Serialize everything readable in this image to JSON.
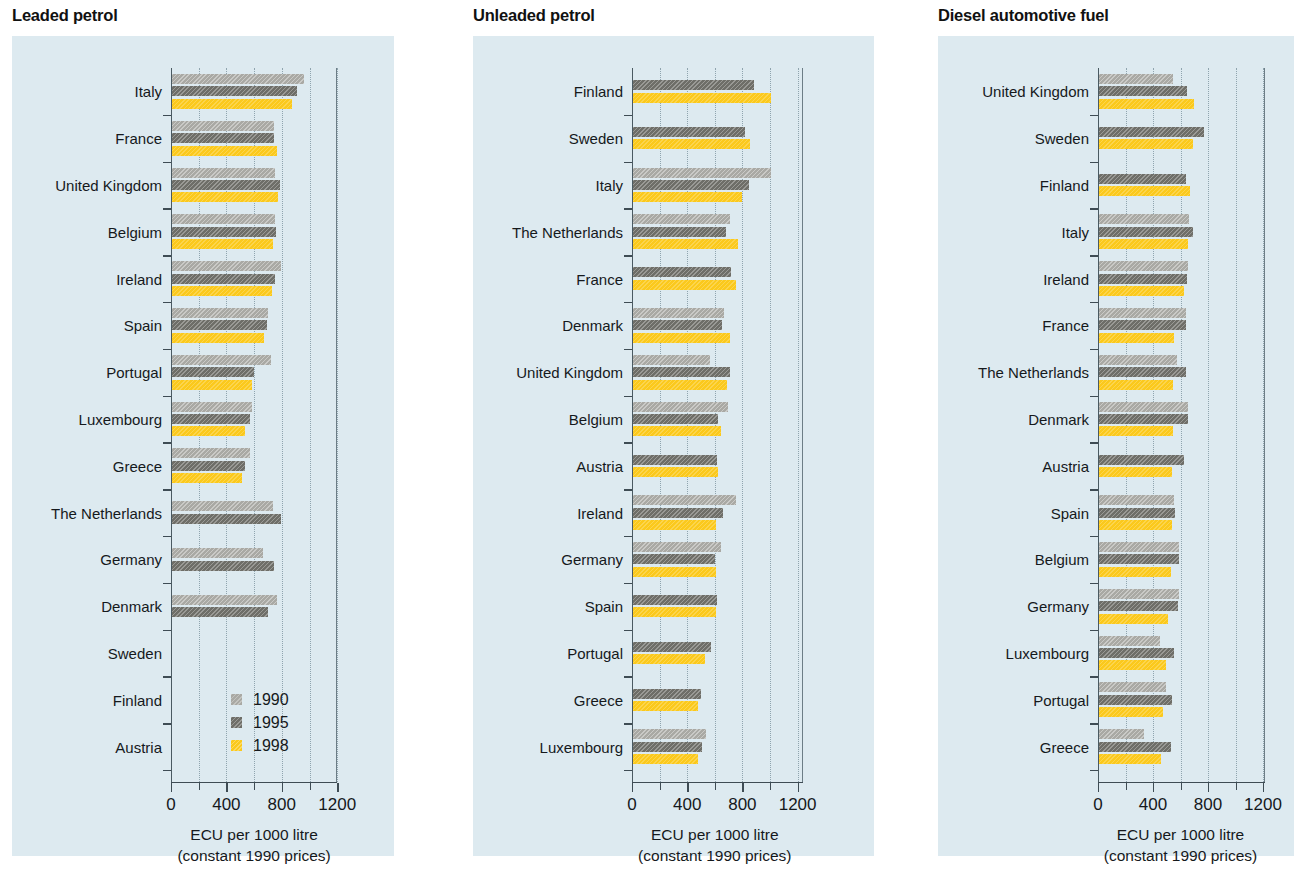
{
  "legend": {
    "entries": [
      {
        "label": "1990",
        "color": "#a9a9a4"
      },
      {
        "label": "1995",
        "color": "#6e6e68"
      },
      {
        "label": "1998",
        "color": "#fbc91c"
      }
    ]
  },
  "axis": {
    "ticks": [
      0,
      200,
      400,
      600,
      800,
      1000,
      1200
    ],
    "labeled_ticks": [
      "0",
      "400",
      "800",
      "1200"
    ],
    "caption_line1": "ECU per 1000 litre",
    "caption_line2": "(constant 1990 prices)",
    "xmin": 0,
    "xmax": 1290
  },
  "chart_data": [
    {
      "type": "bar",
      "title": "Leaded petrol",
      "orientation": "horizontal",
      "xlabel": "ECU per 1000 litre (constant 1990 prices)",
      "ylabel": "",
      "xlim": [
        0,
        1290
      ],
      "grid": true,
      "legend_position": "bottom-right",
      "categories": [
        "Italy",
        "France",
        "United Kingdom",
        "Belgium",
        "Ireland",
        "Spain",
        "Portugal",
        "Luxembourg",
        "Greece",
        "The Netherlands",
        "Germany",
        "Denmark",
        "Sweden",
        "Finland",
        "Austria"
      ],
      "series": [
        {
          "name": "1990",
          "values": [
            955,
            740,
            745,
            745,
            790,
            690,
            715,
            580,
            560,
            730,
            660,
            760,
            null,
            null,
            null
          ]
        },
        {
          "name": "1995",
          "values": [
            905,
            740,
            780,
            750,
            745,
            685,
            590,
            565,
            530,
            790,
            735,
            690,
            null,
            null,
            null
          ]
        },
        {
          "name": "1998",
          "values": [
            870,
            760,
            765,
            730,
            725,
            665,
            580,
            530,
            505,
            null,
            null,
            null,
            null,
            null,
            null
          ]
        }
      ]
    },
    {
      "type": "bar",
      "title": "Unleaded petrol",
      "orientation": "horizontal",
      "xlabel": "ECU per 1000 litre (constant 1990 prices)",
      "ylabel": "",
      "xlim": [
        0,
        1290
      ],
      "grid": true,
      "legend_position": "none",
      "categories": [
        "Finland",
        "Sweden",
        "Italy",
        "The Netherlands",
        "France",
        "Denmark",
        "United Kingdom",
        "Belgium",
        "Austria",
        "Ireland",
        "Germany",
        "Spain",
        "Portugal",
        "Greece",
        "Luxembourg"
      ],
      "series": [
        {
          "name": "1990",
          "values": [
            null,
            null,
            1000,
            700,
            null,
            660,
            560,
            690,
            null,
            745,
            635,
            null,
            null,
            null,
            530
          ]
        },
        {
          "name": "1995",
          "values": [
            880,
            810,
            840,
            675,
            710,
            645,
            700,
            615,
            610,
            655,
            595,
            610,
            565,
            490,
            500
          ]
        },
        {
          "name": "1998",
          "values": [
            1000,
            845,
            790,
            760,
            745,
            700,
            680,
            640,
            615,
            605,
            600,
            600,
            525,
            470,
            470
          ]
        }
      ]
    },
    {
      "type": "bar",
      "title": "Diesel automotive fuel",
      "orientation": "horizontal",
      "xlabel": "ECU per 1000 litre (constant 1990 prices)",
      "ylabel": "",
      "xlim": [
        0,
        1290
      ],
      "grid": true,
      "legend_position": "none",
      "categories": [
        "United Kingdom",
        "Sweden",
        "Finland",
        "Italy",
        "Ireland",
        "France",
        "The Netherlands",
        "Denmark",
        "Austria",
        "Spain",
        "Belgium",
        "Germany",
        "Luxembourg",
        "Portugal",
        "Greece"
      ],
      "series": [
        {
          "name": "1990",
          "values": [
            540,
            null,
            null,
            655,
            645,
            630,
            570,
            650,
            null,
            545,
            585,
            580,
            440,
            490,
            330
          ]
        },
        {
          "name": "1995",
          "values": [
            640,
            760,
            635,
            680,
            640,
            635,
            635,
            650,
            615,
            555,
            585,
            575,
            545,
            530,
            520
          ]
        },
        {
          "name": "1998",
          "values": [
            690,
            685,
            665,
            645,
            620,
            545,
            535,
            535,
            530,
            530,
            520,
            500,
            490,
            465,
            450
          ]
        }
      ]
    }
  ]
}
